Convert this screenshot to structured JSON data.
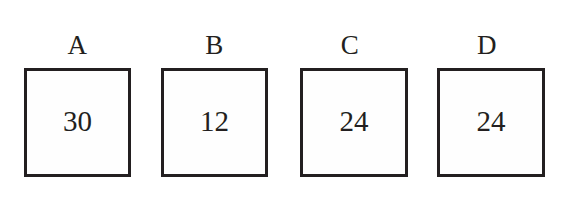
{
  "figure": {
    "background_color": "#ffffff",
    "stroke_color": "#231f20",
    "text_color": "#231f20",
    "box_fill_color": "#fefefe",
    "boxes": [
      {
        "label": "A",
        "value": "30",
        "left": 24,
        "top": 68,
        "width": 107,
        "height": 109,
        "border_width": 3,
        "label_left": 24,
        "label_top": 30,
        "label_width": 107,
        "value_top": 34
      },
      {
        "label": "B",
        "value": "12",
        "left": 161,
        "top": 68,
        "width": 107,
        "height": 109,
        "border_width": 3,
        "label_left": 161,
        "label_top": 30,
        "label_width": 107,
        "value_top": 34
      },
      {
        "label": "C",
        "value": "24",
        "left": 300,
        "top": 68,
        "width": 108,
        "height": 109,
        "border_width": 3,
        "label_left": 296,
        "label_top": 30,
        "label_width": 108,
        "value_top": 34
      },
      {
        "label": "D",
        "value": "24",
        "left": 437,
        "top": 68,
        "width": 108,
        "height": 109,
        "border_width": 3,
        "label_left": 433,
        "label_top": 30,
        "label_width": 108,
        "value_top": 34
      }
    ]
  }
}
